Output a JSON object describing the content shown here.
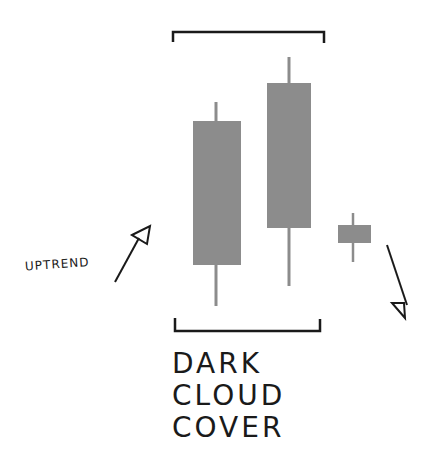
{
  "diagram": {
    "title_lines": [
      "DARK",
      "CLOUD",
      "COVER"
    ],
    "left_label": "UPTREND",
    "colors": {
      "candle": "#8c8c8c",
      "ink": "#1a1a1a",
      "background": "#ffffff"
    },
    "candles": [
      {
        "name": "bullish-candle",
        "wick_top": 102,
        "body_top": 121,
        "body_bottom": 265,
        "wick_bottom": 306,
        "x": 193,
        "width": 48
      },
      {
        "name": "bearish-candle",
        "wick_top": 57,
        "body_top": 83,
        "body_bottom": 228,
        "wick_bottom": 286,
        "x": 267,
        "width": 44
      },
      {
        "name": "small-candle",
        "wick_top": 213,
        "body_top": 225,
        "body_bottom": 243,
        "wick_bottom": 262,
        "x": 338,
        "width": 33
      }
    ],
    "arrows": [
      {
        "name": "uptrend-arrow",
        "direction": "up-right"
      },
      {
        "name": "downtrend-arrow",
        "direction": "down-right"
      }
    ]
  }
}
